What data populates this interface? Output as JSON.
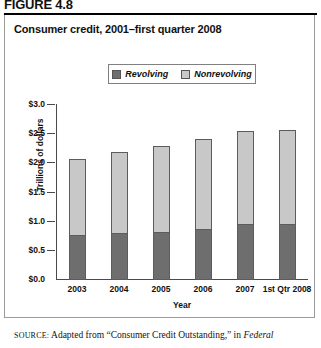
{
  "figure": {
    "label": "FIGURE 4.8",
    "title": "Consumer credit, 2001–first quarter 2008"
  },
  "legend": {
    "items": [
      {
        "label": "Revolving",
        "color": "#6e6e6e"
      },
      {
        "label": "Nonrevolving",
        "color": "#c8c8c8"
      }
    ]
  },
  "axes": {
    "y_title": "Trillions of dollars",
    "x_title": "Year",
    "y_ticks": [
      "$3.0",
      "$2.5",
      "$2.0",
      "$1.5",
      "$1.0",
      "$0.5",
      "$0.0"
    ]
  },
  "source": {
    "prefix": "SOURCE:",
    "text": " Adapted from “Consumer Credit Outstanding,” in ",
    "italic": "Federal"
  },
  "chart_data": {
    "type": "bar",
    "subtype": "stacked-vertical",
    "title": "Consumer credit, 2001–first quarter 2008",
    "xlabel": "Year",
    "ylabel": "Trillions of dollars",
    "ylim": [
      0.0,
      3.0
    ],
    "ytick_step": 0.5,
    "grid": false,
    "legend_position": "top-center",
    "units": "Trillions of dollars",
    "categories": [
      "2003",
      "2004",
      "2005",
      "2006",
      "2007",
      "1st Qtr 2008"
    ],
    "series": [
      {
        "name": "Revolving",
        "color": "#6e6e6e",
        "values": [
          0.77,
          0.8,
          0.83,
          0.88,
          0.96,
          0.96
        ]
      },
      {
        "name": "Nonrevolving",
        "color": "#c8c8c8",
        "values": [
          1.31,
          1.39,
          1.46,
          1.53,
          1.59,
          1.61
        ]
      }
    ],
    "totals": [
      2.08,
      2.19,
      2.29,
      2.41,
      2.55,
      2.57
    ]
  }
}
